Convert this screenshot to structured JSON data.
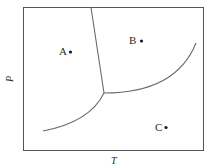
{
  "diagram": {
    "type": "phase-diagram",
    "x_axis": {
      "label": "T"
    },
    "y_axis": {
      "label": "P"
    },
    "points": [
      {
        "label": "A",
        "x": 67,
        "y": 51
      },
      {
        "label": "B",
        "x": 141,
        "y": 41
      },
      {
        "label": "C",
        "x": 165,
        "y": 127
      }
    ],
    "curves": [
      {
        "name": "solid-liquid-boundary",
        "from": [
          91,
          7
        ],
        "to": [
          104,
          93
        ]
      },
      {
        "name": "solid-vapor-boundary",
        "from": [
          43,
          131
        ],
        "to": [
          104,
          93
        ]
      },
      {
        "name": "liquid-vapor-boundary",
        "from": [
          104,
          93
        ],
        "to": [
          196,
          43
        ]
      }
    ],
    "line_color": "#6b6b6b",
    "frame_color": "#555555"
  }
}
